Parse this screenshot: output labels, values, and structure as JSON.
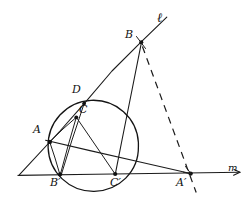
{
  "figure": {
    "background_color": "#ffffff",
    "ink_color": "#1b1b1b",
    "width": 249,
    "height": 205,
    "labels": [
      {
        "id": "label-l",
        "text": "ℓ",
        "x": 157,
        "y": 12,
        "style": "script"
      },
      {
        "id": "label-B",
        "text": "B",
        "x": 125,
        "y": 30,
        "style": "point"
      },
      {
        "id": "label-D",
        "text": "D",
        "x": 72,
        "y": 85,
        "style": "point"
      },
      {
        "id": "label-C",
        "text": "C",
        "x": 79,
        "y": 105,
        "style": "point"
      },
      {
        "id": "label-A",
        "text": "A",
        "x": 33,
        "y": 125,
        "style": "point"
      },
      {
        "id": "label-Bp",
        "text": "B′",
        "x": 50,
        "y": 177,
        "style": "point"
      },
      {
        "id": "label-Cp",
        "text": "C′",
        "x": 111,
        "y": 177,
        "style": "point"
      },
      {
        "id": "label-Ap",
        "text": "A′",
        "x": 176,
        "y": 177,
        "style": "point"
      },
      {
        "id": "label-m",
        "text": "m",
        "x": 227,
        "y": 164,
        "style": "m"
      }
    ],
    "points": [
      {
        "id": "A",
        "x": 50,
        "y": 142
      },
      {
        "id": "B",
        "x": 141,
        "y": 42
      },
      {
        "id": "C",
        "x": 76,
        "y": 117
      },
      {
        "id": "D",
        "x": 84,
        "y": 103
      },
      {
        "id": "Ap",
        "x": 190,
        "y": 174
      },
      {
        "id": "Bp",
        "x": 60,
        "y": 174
      },
      {
        "id": "Cp",
        "x": 115,
        "y": 174
      }
    ],
    "circle": {
      "cx": 93,
      "cy": 146,
      "r": 45.5
    },
    "lines": {
      "m": {
        "x1": 18,
        "y1": 175,
        "x2": 241,
        "y2": 172,
        "dashed": false
      },
      "l": {
        "x1": 20,
        "y1": 174,
        "x2": 167,
        "y2": 17,
        "dashed": false
      },
      "B_Cp": {
        "x1": 141,
        "y1": 42,
        "x2": 115,
        "y2": 174,
        "dashed": false
      },
      "A_Ap": {
        "x1": 46,
        "y1": 140,
        "x2": 192,
        "y2": 174,
        "dashed": false
      },
      "B_Ap_dashed": {
        "x1": 142,
        "y1": 45,
        "x2": 196,
        "y2": 193,
        "dashed": true
      },
      "chord_A_C": {
        "x1": 50,
        "y1": 142,
        "x2": 76,
        "y2": 117
      },
      "chord_C_Cp": {
        "x1": 76,
        "y1": 117,
        "x2": 115,
        "y2": 174
      },
      "chord_A_Bp": {
        "x1": 50,
        "y1": 142,
        "x2": 60,
        "y2": 174
      },
      "chord_C_Bp": {
        "x1": 76,
        "y1": 117,
        "x2": 60,
        "y2": 174
      },
      "chord_D_Bp": {
        "x1": 84,
        "y1": 103,
        "x2": 61,
        "y2": 175
      }
    }
  }
}
